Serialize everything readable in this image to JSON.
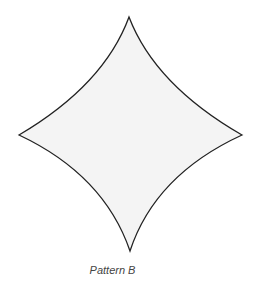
{
  "figure": {
    "caption": "Pattern B",
    "shape": "concave-diamond",
    "fill": "#f4f4f4",
    "stroke": "#222222"
  }
}
